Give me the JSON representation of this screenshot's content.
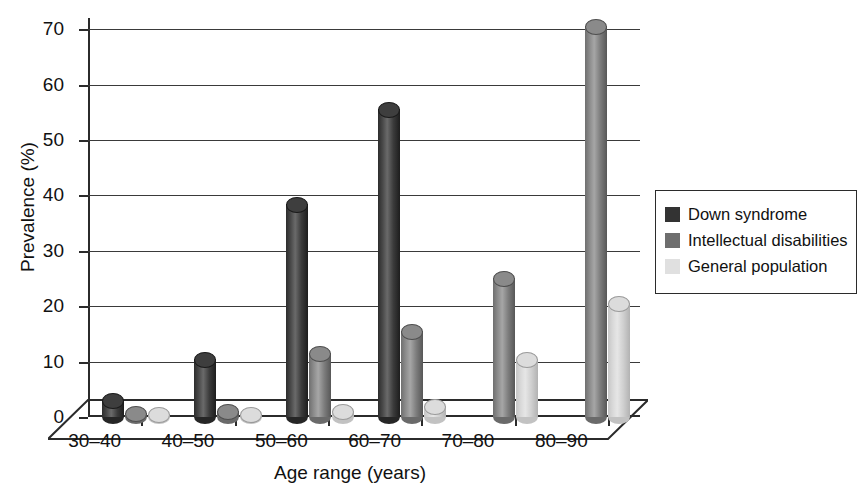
{
  "chart_data": {
    "type": "bar",
    "title": "",
    "subtitle": "",
    "xlabel": "Age range (years)",
    "ylabel": "Prevalence (%)",
    "categories": [
      "30–40",
      "40–50",
      "50–60",
      "60–70",
      "70–80",
      "80–90"
    ],
    "ylim": [
      0,
      72
    ],
    "yticks": [
      0,
      10,
      20,
      30,
      40,
      50,
      60,
      70
    ],
    "ytick_labels": [
      "0",
      "10",
      "20",
      "30",
      "40",
      "50",
      "60",
      "70"
    ],
    "grid": "horizontal",
    "legend_position": "right",
    "style": "3d-cylinder",
    "series": [
      {
        "name": "Down syndrome",
        "color": "#333333",
        "values": [
          3,
          10.5,
          38.5,
          55.5,
          0,
          0
        ]
      },
      {
        "name": "Intellectual disabilities",
        "color": "#6e6e6e",
        "values": [
          0.8,
          1,
          11.5,
          15.5,
          25,
          70.5
        ]
      },
      {
        "name": "General population",
        "color": "#e0e0e0",
        "values": [
          0.5,
          0.6,
          1,
          2,
          10.5,
          20.5
        ]
      }
    ]
  },
  "legend": {
    "items": [
      {
        "label": "Down syndrome",
        "swatch": "#333333"
      },
      {
        "label": "Intellectual disabilities",
        "swatch": "#6e6e6e"
      },
      {
        "label": "General population",
        "swatch": "#e0e0e0"
      }
    ]
  },
  "axes": {
    "x_title": "Age range (years)",
    "y_title": "Prevalence (%)"
  }
}
